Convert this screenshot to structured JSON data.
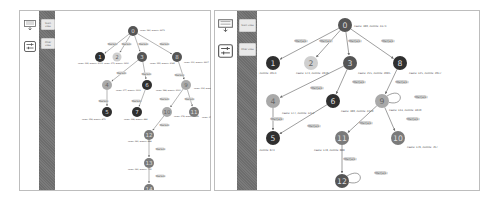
{
  "colors": {
    "node_dark": "#2f2f2f",
    "node_mid": "#555555",
    "node_gray": "#7a7a7a",
    "node_light": "#a9a9a9",
    "node_pale": "#cfcfcf",
    "edge": "#6b6b6b",
    "edge_label_bg": "#d6d6d6",
    "strip": "#707070"
  },
  "left_panel": {
    "toolbar": [
      {
        "name": "process-map-icon"
      },
      {
        "name": "filter-settings-icon"
      }
    ],
    "strip_buttons": [
      {
        "label": "Start view"
      },
      {
        "label": "Filter view"
      }
    ],
    "graph": {
      "nodes": [
        {
          "id": "0",
          "label": "0",
          "x": 77,
          "y": 20,
          "r": 5,
          "shade": "node_mid",
          "info": "cases: 380, events: 2473",
          "ix": 84,
          "iy": 20
        },
        {
          "id": "1",
          "label": "1",
          "x": 44,
          "y": 46,
          "r": 5,
          "shade": "node_dark",
          "info": "cases: 149, events: 2013",
          "ix": 22,
          "iy": 53
        },
        {
          "id": "2",
          "label": "2",
          "x": 61,
          "y": 46,
          "r": 4.5,
          "shade": "node_pale",
          "info": "cases: 173, events: 1930",
          "ix": 48,
          "iy": 53
        },
        {
          "id": "3",
          "label": "3",
          "x": 86,
          "y": 46,
          "r": 5,
          "shade": "node_mid",
          "info": "cases: 355, events: 2085",
          "ix": 94,
          "iy": 53
        },
        {
          "id": "8",
          "label": "8",
          "x": 121,
          "y": 46,
          "r": 5,
          "shade": "node_mid",
          "info": "cases: 131, events: 2917",
          "ix": 128,
          "iy": 52
        },
        {
          "id": "4",
          "label": "4",
          "x": 51,
          "y": 74,
          "r": 5,
          "shade": "node_light",
          "info": "cases: 177, events: 1212",
          "ix": 60,
          "iy": 80
        },
        {
          "id": "6",
          "label": "6",
          "x": 91,
          "y": 74,
          "r": 5,
          "shade": "node_dark",
          "info": "cases: 388, events: 2310",
          "ix": 100,
          "iy": 80
        },
        {
          "id": "9",
          "label": "9",
          "x": 130,
          "y": 74,
          "r": 5,
          "shade": "node_light",
          "info": "cases: 134, events: 1830",
          "ix": 138,
          "iy": 78
        },
        {
          "id": "5",
          "label": "5",
          "x": 51,
          "y": 101,
          "r": 5,
          "shade": "node_dark",
          "info": "cases: 158, events: 873",
          "ix": 26,
          "iy": 109
        },
        {
          "id": "7",
          "label": "7",
          "x": 81,
          "y": 101,
          "r": 5,
          "shade": "node_dark",
          "info": "cases: 148, events: 889",
          "ix": 68,
          "iy": 109
        },
        {
          "id": "10",
          "label": "10",
          "x": 111,
          "y": 101,
          "r": 5,
          "shade": "node_light",
          "info": "cases: 178, events: 1849",
          "ix": 118,
          "iy": 106
        },
        {
          "id": "11",
          "label": "11",
          "x": 138,
          "y": 101,
          "r": 5,
          "shade": "node_gray",
          "info": "cases: 176, events: 767",
          "ix": 146,
          "iy": 107
        },
        {
          "id": "12",
          "label": "12",
          "x": 93,
          "y": 124,
          "r": 5,
          "shade": "node_gray",
          "info": "cases: 181, events: 888",
          "ix": 72,
          "iy": 131
        },
        {
          "id": "13",
          "label": "13",
          "x": 93,
          "y": 152,
          "r": 5,
          "shade": "node_gray",
          "info": "cases: 181, events: 735",
          "ix": 72,
          "iy": 159
        },
        {
          "id": "14",
          "label": "14",
          "x": 93,
          "y": 178,
          "r": 5,
          "shade": "node_gray",
          "info": "cases: 181, events: 728",
          "ix": 72,
          "iy": 182
        }
      ],
      "edges": [
        {
          "from": "0",
          "to": "1",
          "label": "filter(a,b)",
          "lx": 52,
          "ly": 33
        },
        {
          "from": "0",
          "to": "2",
          "label": "filter(a,b)",
          "lx": 66,
          "ly": 33
        },
        {
          "from": "0",
          "to": "3",
          "label": "filter(a,b)",
          "lx": 83,
          "ly": 33
        },
        {
          "from": "0",
          "to": "8",
          "label": "filter(a,b)",
          "lx": 104,
          "ly": 33
        },
        {
          "from": "3",
          "to": "4",
          "label": "filter(a,b)",
          "lx": 61,
          "ly": 62
        },
        {
          "from": "3",
          "to": "6",
          "label": "filter(a,b)",
          "lx": 86,
          "ly": 63
        },
        {
          "from": "8",
          "to": "9",
          "label": "filter(a,b)",
          "lx": 119,
          "ly": 64
        },
        {
          "from": "4",
          "to": "5",
          "label": "filter(a,b)",
          "lx": 43,
          "ly": 90
        },
        {
          "from": "6",
          "to": "7",
          "label": "filter(a,b)",
          "lx": 76,
          "ly": 90
        },
        {
          "from": "9",
          "to": "10",
          "label": "filter(a,b)",
          "lx": 104,
          "ly": 88
        },
        {
          "from": "9",
          "to": "11",
          "label": "filter(a,b)",
          "lx": 129,
          "ly": 88
        },
        {
          "from": "10",
          "to": "12",
          "label": "filter(a,b)",
          "lx": 104,
          "ly": 114
        },
        {
          "from": "12",
          "to": "13",
          "label": "filter(a,b)",
          "lx": 100,
          "ly": 138
        },
        {
          "from": "13",
          "to": "14",
          "label": "filter(a,b)",
          "lx": 100,
          "ly": 165
        }
      ]
    }
  },
  "right_panel": {
    "toolbar": [
      {
        "name": "process-map-icon"
      },
      {
        "name": "filter-settings-icon"
      }
    ],
    "strip_buttons": [
      {
        "label": "Start view"
      },
      {
        "label": "Filter view"
      }
    ],
    "graph": {
      "nodes": [
        {
          "id": "0",
          "label": "0",
          "x": 87,
          "y": 14,
          "r": 7,
          "shade": "node_mid",
          "info": "cases: 380, events: 2473",
          "ix": 96,
          "iy": 16
        },
        {
          "id": "1",
          "label": "1",
          "x": 15,
          "y": 52,
          "r": 7,
          "shade": "node_dark",
          "info": "cases: 749, events: 2013",
          "ix": -14,
          "iy": 63
        },
        {
          "id": "2",
          "label": "2",
          "x": 53,
          "y": 52,
          "r": 7,
          "shade": "node_pale",
          "info": "cases: 173, events: 1930",
          "ix": 38,
          "iy": 63
        },
        {
          "id": "3",
          "label": "3",
          "x": 92,
          "y": 52,
          "r": 7,
          "shade": "node_mid",
          "info": "cases: 255, events: 2085",
          "ix": 100,
          "iy": 63
        },
        {
          "id": "8",
          "label": "8",
          "x": 142,
          "y": 52,
          "r": 7,
          "shade": "node_dark",
          "info": "cases: 125, events: 2917",
          "ix": 151,
          "iy": 63
        },
        {
          "id": "4",
          "label": "4",
          "x": 15,
          "y": 90,
          "r": 7,
          "shade": "node_light",
          "info": "cases: 177, events: 1212",
          "ix": 24,
          "iy": 103
        },
        {
          "id": "6",
          "label": "6",
          "x": 75,
          "y": 90,
          "r": 7,
          "shade": "node_dark",
          "info": "cases: 380, events: 2310",
          "ix": 83,
          "iy": 101
        },
        {
          "id": "9",
          "label": "9",
          "x": 124,
          "y": 90,
          "r": 7,
          "shade": "node_light",
          "info": "cases: 134, events: 1830",
          "ix": 131,
          "iy": 100
        },
        {
          "id": "5",
          "label": "5",
          "x": 15,
          "y": 127,
          "r": 7,
          "shade": "node_dark",
          "info": "cases: 158, events: 873",
          "ix": -14,
          "iy": 140
        },
        {
          "id": "11",
          "label": "11",
          "x": 84,
          "y": 127,
          "r": 7,
          "shade": "node_gray",
          "info": "cases: 178, events: 888",
          "ix": 56,
          "iy": 140
        },
        {
          "id": "10",
          "label": "10",
          "x": 140,
          "y": 127,
          "r": 7,
          "shade": "node_gray",
          "info": "cases: 176, events: 767",
          "ix": 149,
          "iy": 137
        },
        {
          "id": "12",
          "label": "12",
          "x": 84,
          "y": 170,
          "r": 7,
          "shade": "node_mid",
          "info": "cases: 181, events: 735",
          "ix": 56,
          "iy": 182
        }
      ],
      "edges": [
        {
          "from": "0",
          "to": "1",
          "label": "filter(a,b)",
          "lx": 37,
          "ly": 30
        },
        {
          "from": "0",
          "to": "2",
          "label": "filter(a,b)",
          "lx": 62,
          "ly": 30
        },
        {
          "from": "0",
          "to": "3",
          "label": "filter(a,b)",
          "lx": 91,
          "ly": 30
        },
        {
          "from": "0",
          "to": "8",
          "label": "filter(a,b)",
          "lx": 124,
          "ly": 30
        },
        {
          "from": "3",
          "to": "4",
          "label": "filter(a,b)",
          "lx": 53,
          "ly": 77
        },
        {
          "from": "3",
          "to": "6",
          "label": "filter(a,b)",
          "lx": 95,
          "ly": 71
        },
        {
          "from": "8",
          "to": "9",
          "label": "filter(a,b)",
          "lx": 138,
          "ly": 71
        },
        {
          "from": "4",
          "to": "5",
          "label": "filter(a,b)",
          "lx": 13,
          "ly": 108
        },
        {
          "from": "6",
          "to": "5",
          "label": "filter(a,b)",
          "lx": 50,
          "ly": 115
        },
        {
          "from": "9",
          "to": "11",
          "label": "filter(a,b)",
          "lx": 102,
          "ly": 112
        },
        {
          "from": "9",
          "to": "10",
          "label": "filter(a,b)",
          "lx": 149,
          "ly": 108
        },
        {
          "from": "11",
          "to": "12",
          "label": "filter(a,b)",
          "lx": 86,
          "ly": 148
        }
      ],
      "loops": [
        {
          "node": "9",
          "label": "filter(a,b)",
          "lx": 157,
          "ly": 86
        },
        {
          "node": "12",
          "label": "filter(a,b)",
          "lx": 117,
          "ly": 162
        }
      ]
    }
  }
}
